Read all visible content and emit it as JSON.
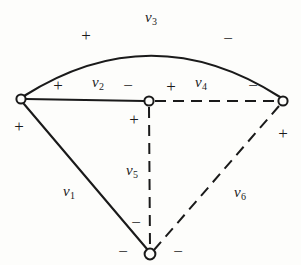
{
  "figure": {
    "background_color": "#fdfdfb",
    "stroke_color": "#1a1a1a",
    "vertices": [
      {
        "name": "left-vertex",
        "x": 21,
        "y": 99,
        "r": 5
      },
      {
        "name": "center-vertex",
        "x": 149,
        "y": 101,
        "r": 5
      },
      {
        "name": "right-vertex",
        "x": 283,
        "y": 101,
        "r": 5
      },
      {
        "name": "bottom-vertex",
        "x": 150,
        "y": 254,
        "r": 6
      }
    ],
    "edges": [
      {
        "name": "edge-v1",
        "label": "v",
        "subscript": "1",
        "style": "solid",
        "from": "left-vertex",
        "to": "bottom-vertex",
        "label_x": 69,
        "label_y": 192
      },
      {
        "name": "edge-v2",
        "label": "v",
        "subscript": "2",
        "style": "solid",
        "from": "left-vertex",
        "to": "center-vertex",
        "label_x": 98,
        "label_y": 83
      },
      {
        "name": "edge-v3",
        "label": "v",
        "subscript": "3",
        "style": "arc",
        "from": "left-vertex",
        "to": "right-vertex",
        "label_x": 151,
        "label_y": 18
      },
      {
        "name": "edge-v4",
        "label": "v",
        "subscript": "4",
        "style": "dashed",
        "from": "center-vertex",
        "to": "right-vertex",
        "label_x": 201,
        "label_y": 83
      },
      {
        "name": "edge-v5",
        "label": "v",
        "subscript": "5",
        "style": "dashed",
        "from": "center-vertex",
        "to": "bottom-vertex",
        "label_x": 132,
        "label_y": 171
      },
      {
        "name": "edge-v6",
        "label": "v",
        "subscript": "6",
        "style": "dashed",
        "from": "right-vertex",
        "to": "bottom-vertex",
        "label_x": 240,
        "label_y": 193
      }
    ],
    "signs": [
      {
        "name": "sign-v3-left",
        "symbol": "+",
        "x": 86,
        "y": 35
      },
      {
        "name": "sign-v3-right",
        "symbol": "−",
        "x": 228,
        "y": 38
      },
      {
        "name": "sign-v2-left",
        "symbol": "+",
        "x": 58,
        "y": 85
      },
      {
        "name": "sign-v2-right",
        "symbol": "−",
        "x": 128,
        "y": 85
      },
      {
        "name": "sign-v4-left",
        "symbol": "+",
        "x": 171,
        "y": 86
      },
      {
        "name": "sign-v4-right",
        "symbol": "−",
        "x": 253,
        "y": 85
      },
      {
        "name": "sign-v1-top",
        "symbol": "+",
        "x": 19,
        "y": 126
      },
      {
        "name": "sign-v6-top",
        "symbol": "+",
        "x": 283,
        "y": 133
      },
      {
        "name": "sign-v5-top",
        "symbol": "+",
        "x": 134,
        "y": 119
      },
      {
        "name": "sign-v5-bottom",
        "symbol": "−",
        "x": 136,
        "y": 222
      },
      {
        "name": "sign-v1-bottom",
        "symbol": "−",
        "x": 123,
        "y": 251
      },
      {
        "name": "sign-v6-bottom",
        "symbol": "−",
        "x": 178,
        "y": 251
      }
    ]
  }
}
